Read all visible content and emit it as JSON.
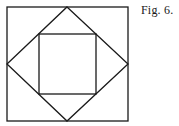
{
  "caption": "Fig. 6.",
  "diagram": {
    "stroke_color": "#1a1a1a",
    "outer_square": {
      "x": 7,
      "y": 7,
      "width": 121,
      "height": 114
    },
    "diamond": {
      "points": "67,7 128,64 67,121 7,64"
    },
    "inner_square": {
      "x": 39,
      "y": 34,
      "width": 57,
      "height": 60
    }
  }
}
